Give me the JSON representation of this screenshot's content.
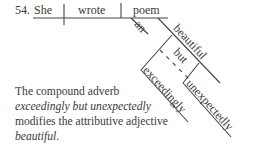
{
  "diagram": {
    "number": "54.",
    "subject": "She",
    "verb": "wrote",
    "object": "poem",
    "modifiers": {
      "article": "an",
      "adjective": "beautiful",
      "conjunction": "but",
      "adverb1": "exceedingly",
      "adverb2": "unexpectedly"
    },
    "line_color": "#444444"
  },
  "caption": {
    "line1": "The compound adverb",
    "line2": "exceedingly but unexpectedly",
    "line3_a": "modifies the attributive adjective",
    "line4_word": "beautiful",
    "line4_end": "."
  }
}
